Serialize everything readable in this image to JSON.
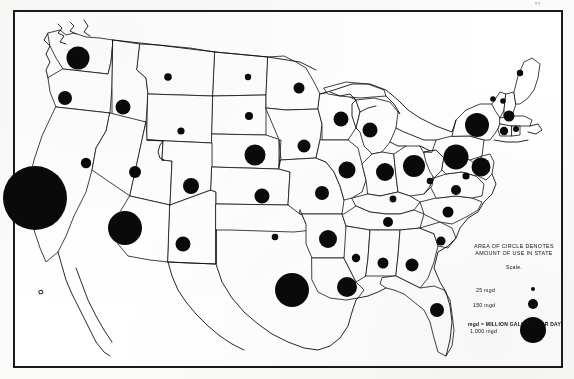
{
  "page": {
    "corner_mark": "''"
  },
  "legend": {
    "heading_line1": "AREA OF CIRCLE DENOTES",
    "heading_line2": "AMOUNT OF USE IN STATE",
    "scale_label": "Scale.",
    "items": [
      {
        "label": "25 mgd",
        "value": 25,
        "diameter_px": 4
      },
      {
        "label": "150 mgd",
        "value": 150,
        "diameter_px": 10
      },
      {
        "label": "1,000 mgd",
        "value": 1000,
        "diameter_px": 26
      }
    ],
    "footnote": "mgd = MILLION GALLONS PER DAY"
  },
  "chart_data": {
    "type": "scatter",
    "title": "AREA OF CIRCLE DENOTES AMOUNT OF USE IN STATE",
    "subtitle": "mgd = MILLION GALLONS PER DAY",
    "units": "mgd (million gallons per day)",
    "symbol": "proportional circle (area proportional to value)",
    "legend_breaks": [
      25,
      150,
      1000
    ],
    "xlabel": "",
    "ylabel": "",
    "grid": false,
    "legend_position": "lower-right",
    "series": [
      {
        "name": "Water use in state (mgd)",
        "points": [
          {
            "state": "Washington",
            "x": 78,
            "y": 58,
            "r": 11.5,
            "value": 800
          },
          {
            "state": "Oregon",
            "x": 65,
            "y": 98,
            "r": 7.0,
            "value": 300
          },
          {
            "state": "Idaho",
            "x": 123,
            "y": 107,
            "r": 7.5,
            "value": 340
          },
          {
            "state": "Montana",
            "x": 168,
            "y": 77,
            "r": 3.8,
            "value": 90
          },
          {
            "state": "Wyoming",
            "x": 181,
            "y": 131,
            "r": 3.6,
            "value": 80
          },
          {
            "state": "North Dakota",
            "x": 248,
            "y": 77,
            "r": 3.2,
            "value": 60
          },
          {
            "state": "South Dakota",
            "x": 249,
            "y": 116,
            "r": 4.0,
            "value": 95
          },
          {
            "state": "Nebraska",
            "x": 255,
            "y": 155,
            "r": 10.5,
            "value": 680
          },
          {
            "state": "California",
            "x": 35,
            "y": 198,
            "r": 32.0,
            "value": 6000
          },
          {
            "state": "Nevada",
            "x": 86,
            "y": 163,
            "r": 5.2,
            "value": 170
          },
          {
            "state": "Utah",
            "x": 135,
            "y": 172,
            "r": 6.0,
            "value": 220
          },
          {
            "state": "Arizona",
            "x": 125,
            "y": 228,
            "r": 17.0,
            "value": 1800
          },
          {
            "state": "Colorado",
            "x": 191,
            "y": 186,
            "r": 8.0,
            "value": 390
          },
          {
            "state": "New Mexico",
            "x": 183,
            "y": 244,
            "r": 7.5,
            "value": 340
          },
          {
            "state": "Kansas",
            "x": 262,
            "y": 196,
            "r": 7.5,
            "value": 340
          },
          {
            "state": "Oklahoma",
            "x": 275,
            "y": 237,
            "r": 3.3,
            "value": 65
          },
          {
            "state": "Texas",
            "x": 292,
            "y": 290,
            "r": 17.0,
            "value": 1800
          },
          {
            "state": "Minnesota",
            "x": 299,
            "y": 88,
            "r": 5.5,
            "value": 190
          },
          {
            "state": "Iowa",
            "x": 304,
            "y": 146,
            "r": 6.5,
            "value": 260
          },
          {
            "state": "Missouri",
            "x": 322,
            "y": 193,
            "r": 7.0,
            "value": 300
          },
          {
            "state": "Arkansas",
            "x": 328,
            "y": 239,
            "r": 9.0,
            "value": 490
          },
          {
            "state": "Louisiana",
            "x": 347,
            "y": 287,
            "r": 10.0,
            "value": 600
          },
          {
            "state": "Wisconsin",
            "x": 341,
            "y": 119,
            "r": 7.5,
            "value": 340
          },
          {
            "state": "Illinois",
            "x": 347,
            "y": 170,
            "r": 8.5,
            "value": 430
          },
          {
            "state": "Michigan",
            "x": 370,
            "y": 130,
            "r": 7.5,
            "value": 340
          },
          {
            "state": "Indiana",
            "x": 385,
            "y": 172,
            "r": 9.0,
            "value": 490
          },
          {
            "state": "Ohio",
            "x": 414,
            "y": 166,
            "r": 11.0,
            "value": 740
          },
          {
            "state": "Kentucky",
            "x": 393,
            "y": 199,
            "r": 3.4,
            "value": 70
          },
          {
            "state": "Tennessee",
            "x": 388,
            "y": 222,
            "r": 5.0,
            "value": 160
          },
          {
            "state": "Mississippi",
            "x": 356,
            "y": 258,
            "r": 4.2,
            "value": 110
          },
          {
            "state": "Alabama",
            "x": 383,
            "y": 263,
            "r": 5.5,
            "value": 190
          },
          {
            "state": "Georgia",
            "x": 412,
            "y": 265,
            "r": 6.5,
            "value": 260
          },
          {
            "state": "Florida",
            "x": 437,
            "y": 310,
            "r": 7.0,
            "value": 300
          },
          {
            "state": "South Carolina",
            "x": 441,
            "y": 241,
            "r": 4.5,
            "value": 130
          },
          {
            "state": "North Carolina",
            "x": 448,
            "y": 212,
            "r": 5.5,
            "value": 190
          },
          {
            "state": "Virginia",
            "x": 456,
            "y": 190,
            "r": 5.0,
            "value": 160
          },
          {
            "state": "West Virginia",
            "x": 430,
            "y": 181,
            "r": 3.3,
            "value": 65
          },
          {
            "state": "Maryland",
            "x": 466,
            "y": 176,
            "r": 3.6,
            "value": 80
          },
          {
            "state": "Pennsylvania",
            "x": 456,
            "y": 157,
            "r": 12.5,
            "value": 950
          },
          {
            "state": "New Jersey",
            "x": 481,
            "y": 167,
            "r": 9.5,
            "value": 540
          },
          {
            "state": "New York",
            "x": 477,
            "y": 125,
            "r": 12.0,
            "value": 880
          },
          {
            "state": "Vermont",
            "x": 493,
            "y": 99,
            "r": 2.8,
            "value": 45
          },
          {
            "state": "New Hampshire",
            "x": 503,
            "y": 101,
            "r": 2.8,
            "value": 45
          },
          {
            "state": "Maine",
            "x": 520,
            "y": 73,
            "r": 3.2,
            "value": 60
          },
          {
            "state": "Massachusetts",
            "x": 509,
            "y": 116,
            "r": 5.5,
            "value": 190
          },
          {
            "state": "Connecticut",
            "x": 504,
            "y": 131,
            "r": 4.2,
            "value": 110
          },
          {
            "state": "Rhode Island",
            "x": 516,
            "y": 129,
            "r": 3.0,
            "value": 50
          }
        ]
      }
    ]
  }
}
